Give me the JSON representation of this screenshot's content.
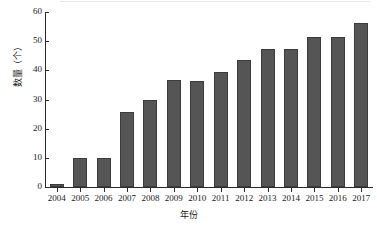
{
  "chart_data": {
    "type": "bar",
    "title": "",
    "xlabel": "年份",
    "ylabel": "数量（个）",
    "categories": [
      "2004",
      "2005",
      "2006",
      "2007",
      "2008",
      "2009",
      "2010",
      "2011",
      "2012",
      "2013",
      "2014",
      "2015",
      "2016",
      "2017"
    ],
    "values": [
      1,
      10,
      10,
      25.7,
      29.7,
      36.6,
      36.5,
      39.4,
      43.4,
      47.4,
      47.4,
      51.4,
      51.4,
      56.3
    ],
    "ylim": [
      0,
      60
    ],
    "y_ticks": [
      "0",
      "10",
      "20",
      "30",
      "40",
      "50",
      "60"
    ],
    "y_tick_values": [
      0,
      10,
      20,
      30,
      40,
      50,
      60
    ],
    "grid": false,
    "legend": "none",
    "bar_color": "#555555",
    "bar_edge_color": "#3c3c3c",
    "axis_color": "#2b2b2b",
    "background_color": "#ffffff"
  }
}
